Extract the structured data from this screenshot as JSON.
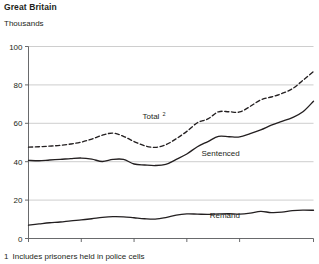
{
  "figure": {
    "title": "Great Britain",
    "subtitle": "Thousands",
    "footnote_marker": "1",
    "footnote_text": "Includes prisoners held in police cells"
  },
  "chart_data": {
    "type": "line",
    "title": "Great Britain",
    "subtitle": "Thousands",
    "xlabel": "",
    "ylabel": "Thousands",
    "xlim": [
      1980,
      2007
    ],
    "ylim": [
      0,
      100
    ],
    "yticks": [
      0,
      20,
      40,
      60,
      80,
      100
    ],
    "ytick_labels": [
      "0",
      "20",
      "40",
      "60",
      "80",
      "100"
    ],
    "xticks": [
      1980,
      1985,
      1990,
      1995,
      2000,
      2007
    ],
    "xtick_labels": [
      "1980",
      "1985",
      "1990",
      "1995",
      "2000",
      "2007"
    ],
    "grid": "horizontal",
    "legend": "inline-annotations",
    "x": [
      1980,
      1981,
      1982,
      1983,
      1984,
      1985,
      1986,
      1987,
      1988,
      1989,
      1990,
      1991,
      1992,
      1993,
      1994,
      1995,
      1996,
      1997,
      1998,
      1999,
      2000,
      2001,
      2002,
      2003,
      2004,
      2005,
      2006,
      2007
    ],
    "series": [
      {
        "name": "Total",
        "superscript": "2",
        "style": "dashed",
        "label_x": 1991.6,
        "label_y": 62,
        "values": [
          47.6,
          47.8,
          48.1,
          48.5,
          49.2,
          50.2,
          51.8,
          53.8,
          54.9,
          53.2,
          50.5,
          48.3,
          47.5,
          48.8,
          52.0,
          55.8,
          60.3,
          62.3,
          66.0,
          66.0,
          65.9,
          68.8,
          72.2,
          73.7,
          75.5,
          78.0,
          82.4,
          87.0
        ],
        "units": "thousands"
      },
      {
        "name": "Sentenced",
        "style": "solid",
        "label_x": 1998.2,
        "label_y": 43,
        "values": [
          40.7,
          40.5,
          40.9,
          41.2,
          41.6,
          41.9,
          41.3,
          40.1,
          41.2,
          41.2,
          38.8,
          38.3,
          38.0,
          38.6,
          41.2,
          44.0,
          47.8,
          50.5,
          53.2,
          53.0,
          52.9,
          54.6,
          56.6,
          59.0,
          61.0,
          63.0,
          66.0,
          71.5
        ],
        "units": "thousands"
      },
      {
        "name": "Remand",
        "style": "solid",
        "label_x": 1998.6,
        "label_y": 10.5,
        "values": [
          7.0,
          7.6,
          8.2,
          8.6,
          9.2,
          9.7,
          10.3,
          11.0,
          11.4,
          11.3,
          10.8,
          10.3,
          10.1,
          10.9,
          12.2,
          12.8,
          12.7,
          12.6,
          12.8,
          12.9,
          12.7,
          13.2,
          14.1,
          13.5,
          13.7,
          14.5,
          14.8,
          14.7
        ],
        "units": "thousands"
      }
    ]
  }
}
